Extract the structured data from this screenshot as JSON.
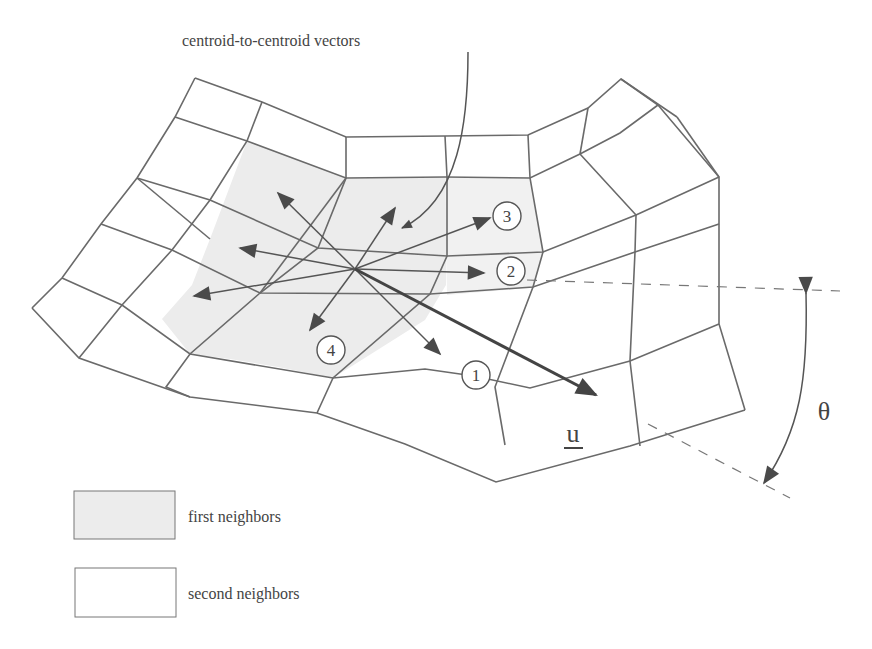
{
  "figure": {
    "callout_label": "centroid-to-centroid vectors",
    "neighbor_labels": [
      "1",
      "2",
      "3",
      "4"
    ],
    "vector_label": "u",
    "angle_label": "θ",
    "colors": {
      "line": "#6a6a6a",
      "arrow": "#4a4a4a",
      "first_neighbor_fill": "#ededed",
      "second_neighbor_fill": "#ffffff"
    }
  },
  "legend": {
    "items": [
      {
        "label": "first neighbors",
        "fill": "#ececec"
      },
      {
        "label": "second neighbors",
        "fill": "#ffffff"
      }
    ]
  }
}
